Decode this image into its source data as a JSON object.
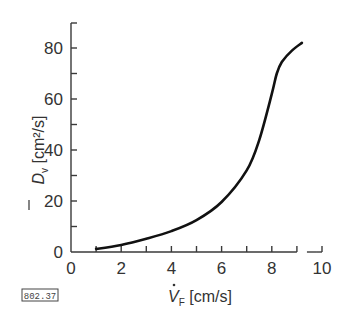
{
  "chart_data": {
    "type": "line",
    "title": "",
    "xlabel": "V̇F [cm/s]",
    "ylabel": "D̄v [cm²/s]",
    "xlim": [
      0,
      10
    ],
    "ylim": [
      0,
      90
    ],
    "x_ticks": [
      0,
      2,
      4,
      6,
      8,
      10
    ],
    "y_ticks": [
      0,
      20,
      40,
      60,
      80
    ],
    "x_minor_ticks": [
      1,
      3,
      5,
      7,
      9
    ],
    "y_minor_ticks": [
      10,
      30,
      50,
      70
    ],
    "grid": false,
    "legend": null,
    "series": [
      {
        "name": "D̄v vs V̇F",
        "x": [
          1.0,
          2.0,
          3.0,
          4.0,
          5.0,
          6.0,
          7.0,
          7.5,
          8.0,
          8.2,
          8.4,
          8.8,
          9.2
        ],
        "y": [
          1.2,
          2.8,
          5.2,
          8.2,
          12.5,
          19.6,
          32.0,
          44.0,
          62.0,
          70.0,
          74.5,
          79.0,
          82.0
        ]
      }
    ],
    "annotations": [
      "802.37"
    ]
  },
  "labels": {
    "x_axis_title_main": "V",
    "x_axis_title_sub": "F",
    "x_axis_title_unit": " [cm/s]",
    "y_axis_title_main": "D",
    "y_axis_title_sub": "v",
    "y_axis_title_unit": " [cm²/s]",
    "figure_id": "802.37"
  }
}
